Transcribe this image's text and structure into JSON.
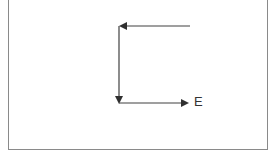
{
  "diagram": {
    "label_e": "E",
    "colors": {
      "line": "#404040",
      "frame": "#8a8a8a"
    },
    "arrows": [
      {
        "name": "top-arrow",
        "from": [
          190,
          26
        ],
        "to": [
          120,
          26
        ],
        "direction": "left"
      },
      {
        "name": "vertical-arrow",
        "from": [
          119,
          26
        ],
        "to": [
          119,
          103
        ],
        "direction": "down"
      },
      {
        "name": "bottom-arrow",
        "from": [
          119,
          103
        ],
        "to": [
          188,
          103
        ],
        "direction": "right"
      }
    ]
  }
}
